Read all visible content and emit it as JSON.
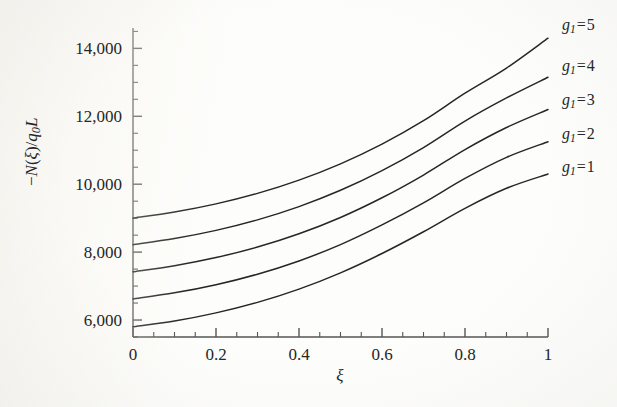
{
  "figure": {
    "background_color": "#fdfdfb",
    "line_color": "#262626",
    "axis_color": "#555555"
  },
  "axes": {
    "x_title": "ξ",
    "y_title_html": "−N(ξ)/q₀L",
    "y_title_parts": {
      "minus": "−",
      "n": "N",
      "paren_open": "(",
      "xi": "ξ",
      "paren_close": ")",
      "slash": "/",
      "q": "q",
      "zero": "0",
      "l": "L"
    },
    "x_tick_labels": [
      "0",
      "0.2",
      "0.4",
      "0.6",
      "0.8",
      "1"
    ],
    "y_tick_labels": [
      "6,000",
      "8,000",
      "10,000",
      "12,000",
      "14,000"
    ]
  },
  "series_labels": [
    {
      "text": "g₁ = 5",
      "g": "g",
      "sub": "1",
      "eq": "=",
      "value": "5"
    },
    {
      "text": "g₁ = 4",
      "g": "g",
      "sub": "1",
      "eq": "=",
      "value": "4"
    },
    {
      "text": "g₁ = 3",
      "g": "g",
      "sub": "1",
      "eq": "=",
      "value": "3"
    },
    {
      "text": "g₁ = 2",
      "g": "g",
      "sub": "1",
      "eq": "=",
      "value": "2"
    },
    {
      "text": "g₁ = 1",
      "g": "g",
      "sub": "1",
      "eq": "=",
      "value": "1"
    }
  ],
  "chart_data": {
    "type": "line",
    "title": "",
    "xlabel": "ξ",
    "ylabel": "−N(ξ)/q₀L",
    "xlim": [
      0,
      1
    ],
    "ylim": [
      5500,
      14600
    ],
    "xticks": [
      0,
      0.2,
      0.4,
      0.6,
      0.8,
      1
    ],
    "yticks": [
      6000,
      8000,
      10000,
      12000,
      14000
    ],
    "x_minor_tick_step": 0.05,
    "y_minor_tick_step": 500,
    "grid": false,
    "legend": "inline-right-end-of-curve",
    "x": [
      0,
      0.1,
      0.2,
      0.3,
      0.4,
      0.5,
      0.6,
      0.7,
      0.8,
      0.9,
      1
    ],
    "series": [
      {
        "name": "g₁ = 5",
        "values": [
          9000,
          9180,
          9420,
          9730,
          10120,
          10600,
          11180,
          11870,
          12680,
          13420,
          14300
        ]
      },
      {
        "name": "g₁ = 4",
        "values": [
          8220,
          8400,
          8640,
          8950,
          9340,
          9820,
          10400,
          11080,
          11860,
          12540,
          13150
        ]
      },
      {
        "name": "g₁ = 3",
        "values": [
          7420,
          7600,
          7840,
          8150,
          8540,
          9020,
          9600,
          10270,
          11020,
          11670,
          12200
        ]
      },
      {
        "name": "g₁ = 2",
        "values": [
          6620,
          6800,
          7040,
          7350,
          7740,
          8220,
          8800,
          9450,
          10170,
          10790,
          11250
        ]
      },
      {
        "name": "g₁ = 1",
        "values": [
          5800,
          5970,
          6210,
          6520,
          6910,
          7390,
          7960,
          8600,
          9290,
          9880,
          10300
        ]
      }
    ]
  }
}
